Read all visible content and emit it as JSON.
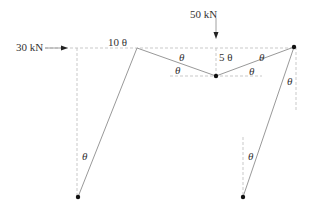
{
  "diagram": {
    "type": "frame-mechanism-virtual-displacement",
    "loads": [
      {
        "label": "30 kN",
        "direction": "right"
      },
      {
        "label": "50 kN",
        "direction": "down"
      }
    ],
    "displacement_labels": {
      "top_left": "10 θ",
      "middle": "5 θ"
    },
    "angle_symbol": "θ",
    "colors": {
      "member": "#999999",
      "dashed": "#bbbbbb",
      "joint": "#111111",
      "text": "#333333"
    }
  }
}
